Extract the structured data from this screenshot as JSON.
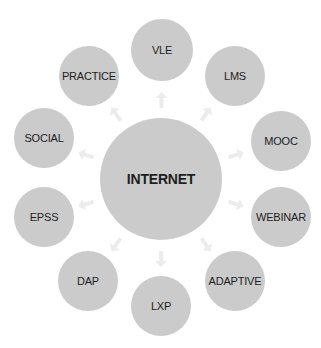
{
  "diagram": {
    "center": {
      "label": "INTERNET",
      "cx": 161,
      "cy": 179,
      "r": 61
    },
    "nodes": [
      {
        "label": "VLE",
        "cx": 162,
        "cy": 50,
        "r": 31
      },
      {
        "label": "LMS",
        "cx": 235,
        "cy": 76,
        "r": 30
      },
      {
        "label": "MOOC",
        "cx": 281,
        "cy": 141,
        "r": 30
      },
      {
        "label": "WEBINAR",
        "cx": 281,
        "cy": 217,
        "r": 30
      },
      {
        "label": "ADAPTIVE",
        "cx": 235,
        "cy": 281,
        "r": 30
      },
      {
        "label": "LXP",
        "cx": 161,
        "cy": 306,
        "r": 30
      },
      {
        "label": "DAP",
        "cx": 88,
        "cy": 281,
        "r": 30
      },
      {
        "label": "EPSS",
        "cx": 44,
        "cy": 217,
        "r": 30
      },
      {
        "label": "SOCIAL",
        "cx": 44,
        "cy": 138,
        "r": 30
      },
      {
        "label": "PRACTICE",
        "cx": 89,
        "cy": 76,
        "r": 30
      }
    ],
    "colors": {
      "node_fill": "#cbcbcb",
      "text": "#1e1e1e",
      "arrow": "#ececec"
    }
  }
}
